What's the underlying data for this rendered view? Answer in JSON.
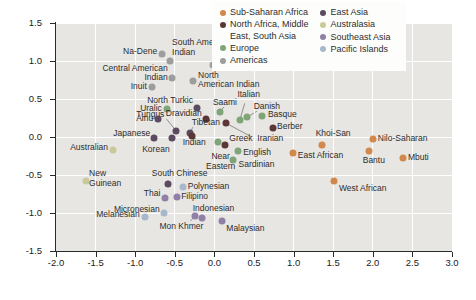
{
  "figure": {
    "background": "#ffffff",
    "plot_background": "#e8e6e2",
    "grid_color": "#ffffff",
    "axis_color": "#2a2a2a",
    "label_color": "#2d2d2d"
  },
  "chart_data": {
    "type": "scatter",
    "title": "",
    "xlabel": "",
    "ylabel": "",
    "xlim": [
      -2.0,
      3.0
    ],
    "ylim": [
      -1.5,
      1.5
    ],
    "grid": true,
    "legend_position": "top-right",
    "x_ticks": [
      {
        "value": -2.0,
        "label": "-2.0"
      },
      {
        "value": -1.5,
        "label": "-1.5"
      },
      {
        "value": -1.0,
        "label": "-1.0"
      },
      {
        "value": -0.5,
        "label": "-0.5"
      },
      {
        "value": 0.0,
        "label": "0.0"
      },
      {
        "value": 0.5,
        "label": "0.5"
      },
      {
        "value": 1.0,
        "label": "1.0"
      },
      {
        "value": 1.5,
        "label": "1.5"
      },
      {
        "value": 2.0,
        "label": "2.0"
      },
      {
        "value": 2.5,
        "label": "2.5"
      },
      {
        "value": 3.0,
        "label": "3.0"
      }
    ],
    "y_ticks": [
      {
        "value": 1.5,
        "label": "1.5"
      },
      {
        "value": 1.0,
        "label": "1.0"
      },
      {
        "value": 0.5,
        "label": "0.5"
      },
      {
        "value": 0.0,
        "label": "0.0"
      },
      {
        "value": -0.5,
        "label": "-0.5"
      },
      {
        "value": -1.0,
        "label": "-1.0"
      },
      {
        "value": -1.5,
        "label": "-1.5"
      }
    ],
    "regions": {
      "sub_saharan_africa": {
        "label": "Sub-Saharan Africa",
        "color": "#d0884c"
      },
      "north_africa_middle_east_south_asia": {
        "label": "North Africa, Middle East, South Asia",
        "color": "#5a3734"
      },
      "europe": {
        "label": "Europe",
        "color": "#7fa477"
      },
      "americas": {
        "label": "Americas",
        "color": "#9d9d9b"
      },
      "east_asia": {
        "label": "East Asia",
        "color": "#5c4a60"
      },
      "australasia": {
        "label": "Australasia",
        "color": "#c9ca97"
      },
      "southeast_asia": {
        "label": "Southeast Asia",
        "color": "#9080a8"
      },
      "pacific_islands": {
        "label": "Pacific Islands",
        "color": "#a7b8cb"
      }
    },
    "legend": {
      "columns": [
        [
          "sub_saharan_africa",
          "north_africa_middle_east_south_asia",
          "europe",
          "americas"
        ],
        [
          "east_asia",
          "australasia",
          "southeast_asia",
          "pacific_islands"
        ]
      ]
    },
    "points": [
      {
        "label": "Na-Dene",
        "region": "americas",
        "x": -0.66,
        "y": 1.09,
        "lx": -5,
        "ly": -2,
        "align": "right"
      },
      {
        "label": "South American\nIndian",
        "region": "americas",
        "x": -0.56,
        "y": 1.0,
        "lx": 2,
        "ly": -13,
        "align": "left"
      },
      {
        "label": "Chukchi",
        "region": "americas",
        "x": -0.02,
        "y": 0.95,
        "lx": 8,
        "ly": -3,
        "align": "left"
      },
      {
        "label": "Central American\nIndian",
        "region": "americas",
        "x": -0.54,
        "y": 0.78,
        "lx": -4,
        "ly": -4,
        "align": "right"
      },
      {
        "label": "North\nAmerican Indian",
        "region": "americas",
        "x": -0.27,
        "y": 0.74,
        "lx": 5,
        "ly": 0,
        "align": "left"
      },
      {
        "label": "Inuit",
        "region": "americas",
        "x": -0.79,
        "y": 0.66,
        "lx": -5,
        "ly": 0,
        "align": "right"
      },
      {
        "label": "North Turkic",
        "region": "east_asia",
        "x": -0.22,
        "y": 0.38,
        "lx": -4,
        "ly": -7,
        "align": "right"
      },
      {
        "label": "Uralic",
        "region": "europe",
        "x": -0.6,
        "y": 0.37,
        "lx": -5,
        "ly": 0,
        "align": "right"
      },
      {
        "label": "Tungus",
        "region": "east_asia",
        "x": -0.48,
        "y": 0.08,
        "lx": -12,
        "ly": -16,
        "align": "right",
        "leader": [
          -10,
          -12
        ]
      },
      {
        "label": "Ainu",
        "region": "east_asia",
        "x": -0.71,
        "y": 0.24,
        "lx": -5,
        "ly": 0,
        "align": "right"
      },
      {
        "label": "Dravidian",
        "region": "north_africa_middle_east_south_asia",
        "x": -0.11,
        "y": 0.24,
        "lx": -4,
        "ly": -5,
        "align": "right"
      },
      {
        "label": "Saami",
        "region": "europe",
        "x": 0.07,
        "y": 0.33,
        "lx": 5,
        "ly": -9,
        "align": "center",
        "leader": [
          4,
          -5
        ]
      },
      {
        "label": "Italian",
        "region": "europe",
        "x": 0.32,
        "y": 0.22,
        "lx": 9,
        "ly": -25,
        "align": "center",
        "leader": [
          5,
          -17
        ]
      },
      {
        "label": "Danish",
        "region": "europe",
        "x": 0.41,
        "y": 0.26,
        "lx": 20,
        "ly": -10,
        "align": "center",
        "leader": [
          10,
          -6
        ]
      },
      {
        "label": "Basque",
        "region": "europe",
        "x": 0.6,
        "y": 0.28,
        "lx": 6,
        "ly": -1,
        "align": "left"
      },
      {
        "label": "Berber",
        "region": "north_africa_middle_east_south_asia",
        "x": 0.74,
        "y": 0.12,
        "lx": 4,
        "ly": -1,
        "align": "left"
      },
      {
        "label": "Iranian",
        "region": "north_africa_middle_east_south_asia",
        "x": 0.15,
        "y": 0.18,
        "lx": 31,
        "ly": 16,
        "align": "left",
        "leader": [
          28,
          15
        ]
      },
      {
        "label": "Tibetan",
        "region": "east_asia",
        "x": -0.31,
        "y": 0.05,
        "lx": 16,
        "ly": -10,
        "align": "center",
        "leader": [
          3,
          -6
        ]
      },
      {
        "label": "Japanese",
        "region": "east_asia",
        "x": -0.76,
        "y": -0.01,
        "lx": -4,
        "ly": -4,
        "align": "right"
      },
      {
        "label": "Korean",
        "region": "east_asia",
        "x": -0.54,
        "y": -0.01,
        "lx": -2,
        "ly": 12,
        "align": "right"
      },
      {
        "label": "Indian",
        "region": "north_africa_middle_east_south_asia",
        "x": -0.28,
        "y": 0.01,
        "lx": 2,
        "ly": 7,
        "align": "center"
      },
      {
        "label": "Greek",
        "region": "europe",
        "x": 0.05,
        "y": -0.07,
        "lx": 11,
        "ly": -3,
        "align": "left"
      },
      {
        "label": "Near\nEastern",
        "region": "north_africa_middle_east_south_asia",
        "x": 0.13,
        "y": -0.11,
        "lx": -4,
        "ly": 17,
        "align": "center"
      },
      {
        "label": "English",
        "region": "europe",
        "x": 0.3,
        "y": -0.18,
        "lx": 5,
        "ly": 2,
        "align": "left"
      },
      {
        "label": "Sardinian",
        "region": "europe",
        "x": 0.23,
        "y": -0.3,
        "lx": 6,
        "ly": 5,
        "align": "left"
      },
      {
        "label": "Khoi-San",
        "region": "sub_saharan_africa",
        "x": 1.36,
        "y": -0.11,
        "lx": 11,
        "ly": -11,
        "align": "center"
      },
      {
        "label": "Nilo-Saharan",
        "region": "sub_saharan_africa",
        "x": 2.0,
        "y": -0.03,
        "lx": 5,
        "ly": 0,
        "align": "left"
      },
      {
        "label": "East African",
        "region": "sub_saharan_africa",
        "x": 0.99,
        "y": -0.21,
        "lx": 5,
        "ly": 3,
        "align": "left"
      },
      {
        "label": "Bantu",
        "region": "sub_saharan_africa",
        "x": 1.95,
        "y": -0.18,
        "lx": 5,
        "ly": 10,
        "align": "center"
      },
      {
        "label": "Mbuti",
        "region": "sub_saharan_africa",
        "x": 2.38,
        "y": -0.28,
        "lx": 5,
        "ly": 0,
        "align": "left"
      },
      {
        "label": "West African",
        "region": "sub_saharan_africa",
        "x": 1.51,
        "y": -0.58,
        "lx": 5,
        "ly": 8,
        "align": "left"
      },
      {
        "label": "Australian",
        "region": "australasia",
        "x": -1.28,
        "y": -0.17,
        "lx": -5,
        "ly": -2,
        "align": "right"
      },
      {
        "label": "New\nGuinean",
        "region": "australasia",
        "x": -1.62,
        "y": -0.58,
        "lx": 3,
        "ly": -2,
        "align": "left"
      },
      {
        "label": "South Chinese",
        "region": "east_asia",
        "x": -0.59,
        "y": -0.62,
        "lx": 12,
        "ly": -10,
        "align": "center"
      },
      {
        "label": "Thai",
        "region": "southeast_asia",
        "x": -0.62,
        "y": -0.8,
        "lx": -5,
        "ly": -4,
        "align": "right"
      },
      {
        "label": "Polynesian",
        "region": "pacific_islands",
        "x": -0.4,
        "y": -0.66,
        "lx": 5,
        "ly": 0,
        "align": "left"
      },
      {
        "label": "Filipino",
        "region": "southeast_asia",
        "x": -0.47,
        "y": -0.79,
        "lx": 4,
        "ly": 0,
        "align": "left"
      },
      {
        "label": "Micronesian",
        "region": "pacific_islands",
        "x": -0.64,
        "y": -1.0,
        "lx": -4,
        "ly": -3,
        "align": "right"
      },
      {
        "label": "Melanesian",
        "region": "pacific_islands",
        "x": -0.88,
        "y": -1.05,
        "lx": -5,
        "ly": -2,
        "align": "right"
      },
      {
        "label": "Indonesian",
        "region": "southeast_asia",
        "x": -0.16,
        "y": -1.07,
        "lx": -9,
        "ly": -9,
        "align": "left"
      },
      {
        "label": "Mon Khmer",
        "region": "southeast_asia",
        "x": -0.24,
        "y": -1.04,
        "lx": -14,
        "ly": 11,
        "align": "center",
        "leader": [
          -5,
          5
        ]
      },
      {
        "label": "Malaysian",
        "region": "southeast_asia",
        "x": 0.1,
        "y": -1.11,
        "lx": 4,
        "ly": 8,
        "align": "left"
      }
    ]
  }
}
